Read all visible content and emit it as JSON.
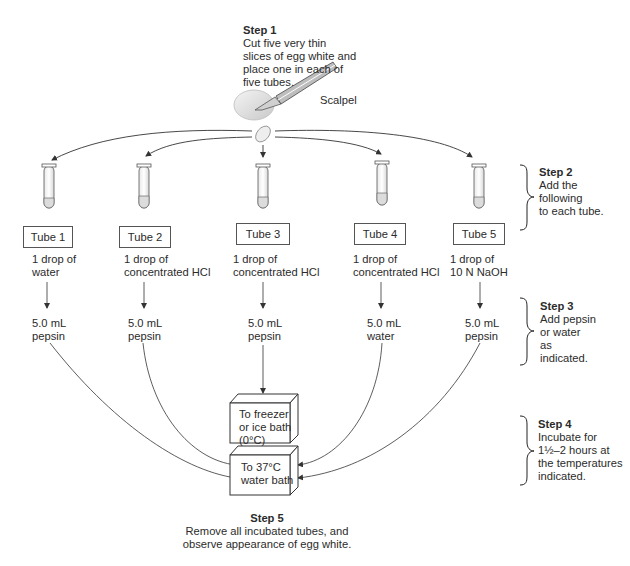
{
  "step1": {
    "title": "Step 1",
    "lines": [
      "Cut five very thin",
      "slices of egg white and",
      "place one in each of",
      "five tubes."
    ],
    "tool_label": "Scalpel"
  },
  "step2": {
    "title": "Step 2",
    "lines": [
      "Add the",
      "following",
      "to each tube."
    ]
  },
  "step3": {
    "title": "Step 3",
    "lines": [
      "Add pepsin",
      "or water",
      "as",
      "indicated."
    ]
  },
  "step4": {
    "title": "Step 4",
    "lines": [
      "Incubate for",
      "1½–2 hours at",
      "the temperatures",
      "indicated."
    ]
  },
  "step5": {
    "title": "Step 5",
    "lines": [
      "Remove all incubated tubes, and",
      "observe appearance of egg white."
    ]
  },
  "tubes": [
    {
      "label": "Tube 1",
      "addition": [
        "1 drop of",
        "water"
      ],
      "reagent": [
        "5.0 mL",
        "pepsin"
      ]
    },
    {
      "label": "Tube 2",
      "addition": [
        "1 drop of",
        "concentrated HCl"
      ],
      "reagent": [
        "5.0 mL",
        "pepsin"
      ]
    },
    {
      "label": "Tube 3",
      "addition": [
        "1 drop of",
        "concentrated HCl"
      ],
      "reagent": [
        "5.0 mL",
        "pepsin"
      ]
    },
    {
      "label": "Tube 4",
      "addition": [
        "1 drop of",
        "concentrated HCl"
      ],
      "reagent": [
        "5.0 mL",
        "water"
      ]
    },
    {
      "label": "Tube 5",
      "addition": [
        "1 drop of",
        "10 N NaOH"
      ],
      "reagent": [
        "5.0 mL",
        "pepsin"
      ]
    }
  ],
  "baths": {
    "cold": [
      "To freezer",
      "or ice bath",
      "(0°C)"
    ],
    "warm": [
      "To 37°C",
      "water bath"
    ]
  },
  "icons": {
    "egg": "egg-icon",
    "scalpel": "scalpel-icon",
    "slice": "egg-slice-icon",
    "tube": "test-tube-icon",
    "bracket": "curly-brace-icon"
  }
}
